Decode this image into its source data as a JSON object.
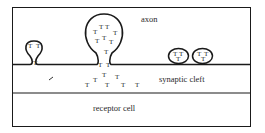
{
  "diagram": {
    "labels": {
      "axon": "axon",
      "synaptic_cleft": "synaptic cleft",
      "receptor_cell": "receptor cell"
    },
    "transmitter_symbol": "T",
    "colors": {
      "line": "#1a1a1a",
      "text": "#2a2a2a",
      "background": "#ffffff"
    },
    "regions": [
      {
        "name": "axon",
        "description": "presynaptic axon terminal (top region)"
      },
      {
        "name": "synaptic cleft",
        "description": "gap between membranes"
      },
      {
        "name": "receptor cell",
        "description": "postsynaptic cell (bottom region)"
      }
    ],
    "vesicles": [
      {
        "name": "fusing-vesicle-small",
        "transmitters_inside": 2,
        "transmitters_in_neck": 1
      },
      {
        "name": "fusing-vesicle-large",
        "transmitters_inside": 10,
        "transmitters_released": 9
      },
      {
        "name": "free-vesicle-1",
        "transmitters_inside": 3
      },
      {
        "name": "free-vesicle-2",
        "transmitters_inside": 3
      }
    ]
  }
}
